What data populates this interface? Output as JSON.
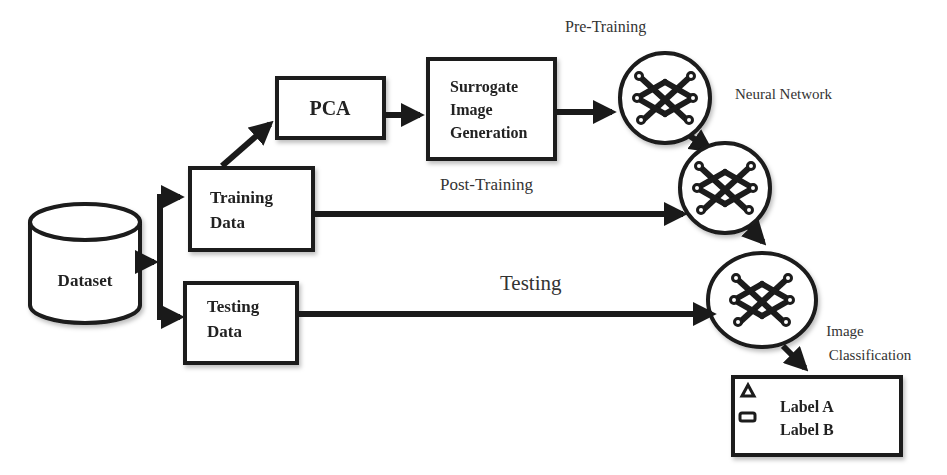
{
  "diagram": {
    "nodes": {
      "dataset": {
        "label": "Dataset"
      },
      "training_data": {
        "line1": "Training",
        "line2": "Data"
      },
      "testing_data": {
        "line1": "Testing",
        "line2": "Data"
      },
      "pca": {
        "label": "PCA"
      },
      "surrogate": {
        "line1": "Surrogate",
        "line2": "Image",
        "line3": "Generation"
      },
      "output": {
        "label_a": "Label A",
        "label_b": "Label B"
      }
    },
    "annotations": {
      "pre_training": "Pre-Training",
      "neural_network": "Neural Network",
      "post_training": "Post-Training",
      "testing": "Testing",
      "image_classification_1": "Image",
      "image_classification_2": "Classification"
    },
    "icons": {
      "neural_network": "neural-network-icon",
      "label_a_marker": "triangle-icon",
      "label_b_marker": "rounded-rect-icon"
    },
    "colors": {
      "stroke": "#1a1a1a",
      "background": "#ffffff",
      "text": "#222222"
    }
  }
}
